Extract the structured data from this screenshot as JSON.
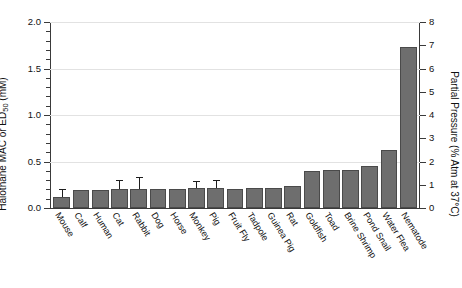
{
  "chart_data": {
    "type": "bar",
    "title": "",
    "xlabel": "",
    "ylabel": "Halothane MAC or ED50 (mM)",
    "ylabel_main": "Halothane MAC or ED",
    "ylabel_sub": "50",
    "ylabel_unit": " (mM)",
    "y2label": "Partial Pressure (% Atm at 37°C)",
    "ylim": [
      0.0,
      2.0
    ],
    "y2lim": [
      0,
      8
    ],
    "grid": true,
    "legend": "none",
    "y_ticks": [
      "0.0",
      "0.5",
      "1.0",
      "1.5",
      "2.0"
    ],
    "y_tick_values": [
      0.0,
      0.5,
      1.0,
      1.5,
      2.0
    ],
    "y_minor_step": 0.1,
    "y2_ticks": [
      "0",
      "1",
      "2",
      "3",
      "4",
      "5",
      "6",
      "7",
      "8"
    ],
    "y2_tick_values": [
      0,
      1,
      2,
      3,
      4,
      5,
      6,
      7,
      8
    ],
    "categories": [
      "Mouse",
      "Calf",
      "Human",
      "Cat",
      "Rabbit",
      "Dog",
      "Horse",
      "Monkey",
      "Pig",
      "Fruit Fly",
      "Tadpole",
      "Guinea Pig",
      "Rat",
      "Goldfish",
      "Toad",
      "Brine Shrimp",
      "Pond Snail",
      "Water Flea",
      "Nematode"
    ],
    "values": [
      0.12,
      0.19,
      0.19,
      0.2,
      0.2,
      0.2,
      0.2,
      0.21,
      0.21,
      0.2,
      0.21,
      0.22,
      0.24,
      0.4,
      0.41,
      0.41,
      0.45,
      0.62,
      1.73
    ],
    "errors": [
      0.07,
      0,
      0,
      0.09,
      0.12,
      0,
      0,
      0.07,
      0.08,
      0,
      0,
      0,
      0,
      0,
      0,
      0,
      0,
      0,
      0
    ],
    "bar_color": "#6e6e6e",
    "bar_edge_color": "#4a4a4a",
    "grid_color": "#e2e2e2",
    "axis_color": "#3a3a3a"
  }
}
